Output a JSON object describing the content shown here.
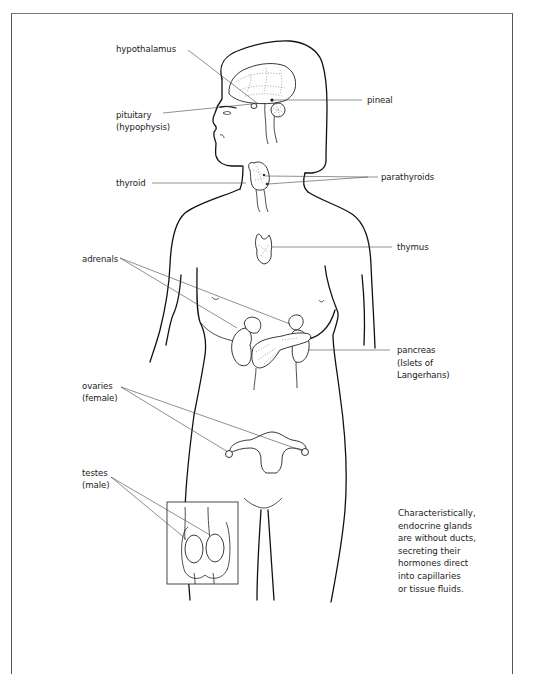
{
  "figure": {
    "labels": {
      "hypothalamus": "hypothalamus",
      "pituitary_1": "pituitary",
      "pituitary_2": "(hypophysis)",
      "pineal": "pineal",
      "thyroid": "thyroid",
      "parathyroids": "parathyroids",
      "thymus": "thymus",
      "adrenals": "adrenals",
      "pancreas_1": "pancreas",
      "pancreas_2": "(Islets of",
      "pancreas_3": "Langerhans)",
      "ovaries_1": "ovaries",
      "ovaries_2": "(female)",
      "testes_1": "testes",
      "testes_2": "(male)"
    },
    "note": "Characteristically,\nendocrine glands\nare without ducts,\nsecreting their\nhormones direct\ninto capillaries\nor tissue fluids.",
    "colors": {
      "line": "#111111",
      "leader": "#444444",
      "background": "#ffffff"
    }
  }
}
